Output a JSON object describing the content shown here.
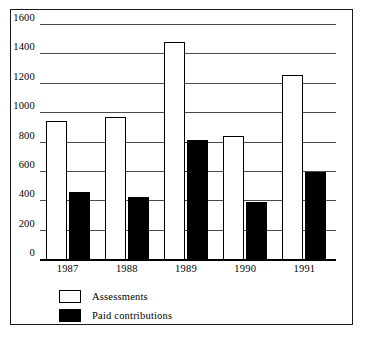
{
  "chart_data": {
    "type": "bar",
    "title": "",
    "subtitle": "",
    "xlabel": "",
    "ylabel": "",
    "categories": [
      "1987",
      "1988",
      "1989",
      "1990",
      "1991"
    ],
    "series": [
      {
        "name": "Assessments",
        "swatch": "white",
        "color": "#ffffff",
        "values": [
          940,
          965,
          1480,
          840,
          1250
        ]
      },
      {
        "name": "Paid contributions",
        "swatch": "black",
        "color": "#000000",
        "values": [
          455,
          425,
          810,
          390,
          595
        ]
      }
    ],
    "ylim": [
      0,
      1600
    ],
    "ytick_step": 200,
    "yticks": [
      0,
      200,
      400,
      600,
      800,
      1000,
      1200,
      1400,
      1600
    ],
    "ytick_labels": [
      "0",
      "200",
      "400",
      "600",
      "800",
      "1000",
      "1200",
      "1400",
      "1600"
    ],
    "grid": true,
    "grid_axis": "y",
    "legend_position": "below-left",
    "frame": true
  },
  "legend": {
    "items": [
      {
        "label": "Assessments",
        "swatch": "white"
      },
      {
        "label": "Paid contributions",
        "swatch": "black"
      }
    ]
  },
  "colors": {
    "assessments": "#ffffff",
    "paid_contributions": "#000000",
    "gridline": "#4a4a4a",
    "axis": "#000000",
    "frame": "#1a1a1a",
    "background": "#ffffff"
  }
}
